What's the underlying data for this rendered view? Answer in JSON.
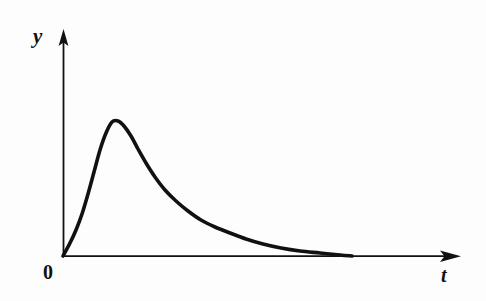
{
  "figure": {
    "background_color": "#fdfdfd",
    "ink_color": "#111111",
    "width": 486,
    "height": 301
  },
  "labels": {
    "y_axis": "y",
    "x_axis": "t",
    "origin": "0"
  },
  "icons": {
    "y_axis_arrow": "arrow-up-icon",
    "x_axis_arrow": "arrow-right-icon"
  },
  "chart_data": {
    "type": "line",
    "title": "",
    "xlabel": "t",
    "ylabel": "y",
    "grid": false,
    "legend": null,
    "axis_arrows": true,
    "origin_label": "0",
    "xlim": [
      0,
      1
    ],
    "ylim": [
      0,
      1
    ],
    "series": [
      {
        "name": "y(t)",
        "color": "#111111",
        "line_width": 3.6,
        "points_pixel": [
          [
            63,
            256
          ],
          [
            70,
            243
          ],
          [
            76,
            230
          ],
          [
            82,
            214
          ],
          [
            88,
            194
          ],
          [
            94,
            172
          ],
          [
            100,
            150
          ],
          [
            106,
            133
          ],
          [
            112,
            122
          ],
          [
            118,
            121
          ],
          [
            124,
            126
          ],
          [
            131,
            136
          ],
          [
            138,
            149
          ],
          [
            146,
            163
          ],
          [
            155,
            177
          ],
          [
            165,
            190
          ],
          [
            176,
            201
          ],
          [
            188,
            211
          ],
          [
            201,
            220
          ],
          [
            215,
            227
          ],
          [
            230,
            233
          ],
          [
            246,
            239
          ],
          [
            263,
            244
          ],
          [
            281,
            248
          ],
          [
            300,
            251
          ],
          [
            320,
            253
          ],
          [
            340,
            255
          ],
          [
            352,
            256
          ]
        ],
        "x_normalized": [
          0.0,
          0.02,
          0.03,
          0.05,
          0.06,
          0.08,
          0.09,
          0.11,
          0.12,
          0.14,
          0.15,
          0.17,
          0.19,
          0.21,
          0.23,
          0.26,
          0.28,
          0.31,
          0.35,
          0.38,
          0.42,
          0.46,
          0.5,
          0.55,
          0.6,
          0.65,
          0.7,
          0.73
        ],
        "y_normalized": [
          0.0,
          0.06,
          0.12,
          0.19,
          0.27,
          0.37,
          0.47,
          0.54,
          0.59,
          0.6,
          0.57,
          0.53,
          0.47,
          0.41,
          0.35,
          0.29,
          0.24,
          0.2,
          0.16,
          0.13,
          0.1,
          0.08,
          0.05,
          0.04,
          0.02,
          0.01,
          0.0,
          0.0
        ]
      }
    ],
    "peak": {
      "x_pixel": 114,
      "y_pixel": 121,
      "x_normalized": 0.13,
      "y_normalized": 0.6
    },
    "axes": {
      "origin_pixel": [
        63,
        256
      ],
      "y_axis_top_pixel": [
        63,
        30
      ],
      "x_axis_right_pixel": [
        461,
        256
      ]
    }
  }
}
